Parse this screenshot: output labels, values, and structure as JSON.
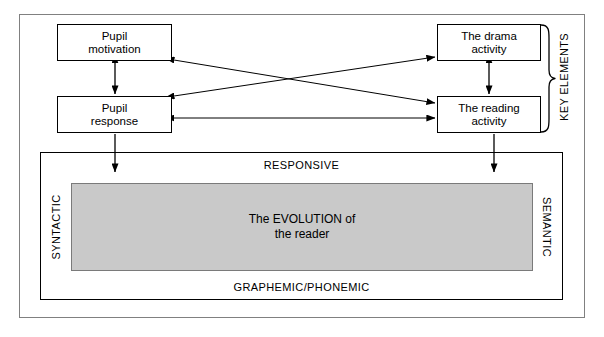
{
  "diagram": {
    "title": "The evolution of the reader",
    "key_elements_caption": "KEY ELEMENTS",
    "boxes": {
      "pupil_motivation": {
        "line1": "Pupil",
        "line2": "motivation"
      },
      "pupil_response": {
        "line1": "Pupil",
        "line2": "response"
      },
      "drama_activity": {
        "line1": "The drama",
        "line2": "activity"
      },
      "reading_activity": {
        "line1": "The reading",
        "line2": "activity"
      }
    },
    "lower_panel": {
      "top_label": "RESPONSIVE",
      "bottom_label": "GRAPHEMIC/PHONEMIC",
      "left_label": "SYNTACTIC",
      "right_label": "SEMANTIC",
      "center": {
        "line1": "The EVOLUTION of",
        "line2": "the reader"
      }
    },
    "colors": {
      "grey_block_fill": "#c9c9c9",
      "grey_block_border": "#7a7a7a",
      "line": "#000000",
      "outer_frame": "#808080",
      "background": "#ffffff"
    }
  }
}
